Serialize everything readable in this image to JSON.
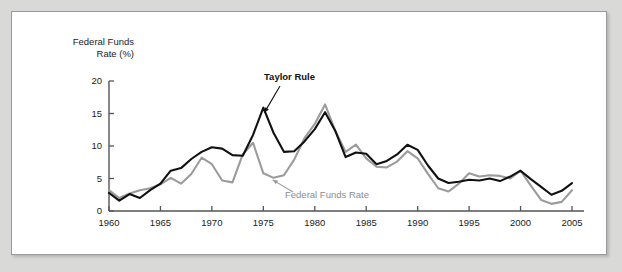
{
  "figure": {
    "background_color": "#d9d9d7",
    "panel_color": "#ffffff",
    "panel_border_color": "#9a9a9a"
  },
  "axis_title": "Federal Funds\nRate (%)",
  "labels": {
    "taylor_rule": "Taylor Rule",
    "federal_funds_rate": "Federal Funds Rate"
  },
  "colors": {
    "taylor_rule_line": "#111111",
    "federal_funds_rate_line": "#9b9b9b",
    "axis": "#555555",
    "text": "#1b1b1b",
    "gray_text": "#8c8c8c"
  },
  "chart_data": {
    "type": "line",
    "title": "",
    "subtitle": "",
    "xlabel": "",
    "ylabel": "Federal Funds Rate (%)",
    "xlim": [
      1960,
      2005
    ],
    "ylim": [
      0,
      20
    ],
    "xticks": [
      1960,
      1965,
      1970,
      1975,
      1980,
      1985,
      1990,
      1995,
      2000,
      2005
    ],
    "xticklabels": [
      "1960",
      "1965",
      "1970",
      "1975",
      "1980",
      "1985",
      "1990",
      "1995",
      "2000",
      "2005"
    ],
    "yticks": [
      0,
      5,
      10,
      15,
      20
    ],
    "yticklabels": [
      "0",
      "5",
      "10",
      "15",
      "20"
    ],
    "grid": false,
    "legend": "inline-annotations",
    "x": [
      1960,
      1961,
      1962,
      1963,
      1964,
      1965,
      1966,
      1967,
      1968,
      1969,
      1970,
      1971,
      1972,
      1973,
      1974,
      1975,
      1976,
      1977,
      1978,
      1979,
      1980,
      1981,
      1982,
      1983,
      1984,
      1985,
      1986,
      1987,
      1988,
      1989,
      1990,
      1991,
      1992,
      1993,
      1994,
      1995,
      1996,
      1997,
      1998,
      1999,
      2000,
      2001,
      2002,
      2003,
      2004,
      2005
    ],
    "series": [
      {
        "name": "Taylor Rule",
        "color": "#111111",
        "linewidth": 2.1,
        "values": [
          2.8,
          1.6,
          2.6,
          2.0,
          3.2,
          4.2,
          6.2,
          6.6,
          8.0,
          9.1,
          9.8,
          9.6,
          8.6,
          8.5,
          11.7,
          15.9,
          12.0,
          9.1,
          9.2,
          10.7,
          12.6,
          15.2,
          12.3,
          8.3,
          9.0,
          8.8,
          7.2,
          7.7,
          8.7,
          10.2,
          9.4,
          7.0,
          5.0,
          4.3,
          4.5,
          4.8,
          4.7,
          5.0,
          4.6,
          5.3,
          6.2,
          4.9,
          3.7,
          2.5,
          3.1,
          4.3
        ]
      },
      {
        "name": "Federal Funds Rate",
        "color": "#9b9b9b",
        "linewidth": 2.1,
        "values": [
          3.2,
          2.0,
          2.7,
          3.2,
          3.5,
          4.1,
          5.1,
          4.2,
          5.7,
          8.2,
          7.2,
          4.7,
          4.4,
          8.7,
          10.5,
          5.8,
          5.1,
          5.5,
          7.9,
          11.2,
          13.4,
          16.4,
          12.3,
          9.1,
          10.2,
          8.1,
          6.8,
          6.7,
          7.6,
          9.2,
          8.1,
          5.7,
          3.5,
          3.0,
          4.2,
          5.8,
          5.3,
          5.5,
          5.4,
          5.0,
          6.2,
          3.9,
          1.7,
          1.1,
          1.4,
          3.2
        ]
      }
    ],
    "annotations": [
      {
        "text": "Taylor Rule",
        "points_to_year": 1975,
        "points_to_value": 15.9,
        "series": "Taylor Rule"
      },
      {
        "text": "Federal Funds Rate",
        "points_to_year": 1976,
        "points_to_value": 5.1,
        "series": "Federal Funds Rate"
      }
    ]
  }
}
